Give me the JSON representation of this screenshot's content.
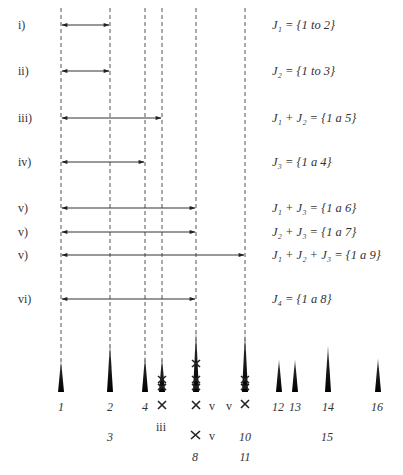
{
  "rows": [
    {
      "label": "i)",
      "y": 25,
      "to": 110,
      "eq": "J₁ = {1 to 2}"
    },
    {
      "label": "ii)",
      "y": 71,
      "to": 110,
      "eq": "J₂ = {1 to 3}"
    },
    {
      "label": "iii)",
      "y": 118,
      "to": 162,
      "eq": "J₁ + J₂ = {1 a 5}"
    },
    {
      "label": "iv)",
      "y": 162,
      "to": 145,
      "eq": "J₃ = {1 a 4}"
    },
    {
      "label": "v)",
      "y": 208,
      "to": 196,
      "eq": "J₁ + J₃ = {1 a 6}"
    },
    {
      "label": "v)",
      "y": 232,
      "to": 196,
      "eq": "J₂ + J₃ = {1 a 7}"
    },
    {
      "label": "v)",
      "y": 255,
      "to": 245,
      "eq": "J₁ + J₂ + J₃ = {1 a 9}"
    },
    {
      "label": "vi)",
      "y": 299,
      "to": 196,
      "eq": "J₄ = {1 a 8}"
    }
  ],
  "dashed_lines_x": [
    61,
    110,
    145,
    162,
    196,
    245
  ],
  "bottom_labels": [
    {
      "text": "1",
      "x": 61,
      "y": 411
    },
    {
      "text": "2",
      "x": 110,
      "y": 411
    },
    {
      "text": "4",
      "x": 145,
      "y": 411
    },
    {
      "text": "12",
      "x": 278,
      "y": 411
    },
    {
      "text": "13",
      "x": 295,
      "y": 411
    },
    {
      "text": "14",
      "x": 328,
      "y": 411
    },
    {
      "text": "16",
      "x": 377,
      "y": 411
    },
    {
      "text": "3",
      "x": 110,
      "y": 441
    },
    {
      "text": "15",
      "x": 327,
      "y": 441
    },
    {
      "text": "10",
      "x": 245,
      "y": 441
    },
    {
      "text": "8",
      "x": 195,
      "y": 461
    },
    {
      "text": "11",
      "x": 245,
      "y": 461
    }
  ],
  "roman_labels": [
    {
      "text": "iii",
      "x": 161,
      "y": 431
    },
    {
      "text": "v",
      "x": 212,
      "y": 410
    },
    {
      "text": "v",
      "x": 229,
      "y": 410
    },
    {
      "text": "v",
      "x": 212,
      "y": 440
    }
  ]
}
